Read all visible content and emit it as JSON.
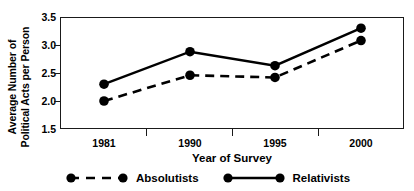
{
  "chart_data": {
    "type": "line",
    "title": "",
    "xlabel": "Year of Survey",
    "ylabel_line1": "Average Number of",
    "ylabel_line2": "Political Acts per Person",
    "categories": [
      "1981",
      "1990",
      "1995",
      "2000"
    ],
    "yticks": [
      "1.5",
      "2.0",
      "2.5",
      "3.0",
      "3.5"
    ],
    "ylim": [
      1.5,
      3.5
    ],
    "grid": false,
    "legend_position": "bottom",
    "series": [
      {
        "name": "Absolutists",
        "style": "dashed",
        "marker": "filled-circle",
        "color": "#000000",
        "values": [
          2.0,
          2.46,
          2.42,
          3.08
        ]
      },
      {
        "name": "Relativists",
        "style": "solid",
        "marker": "filled-circle",
        "color": "#000000",
        "values": [
          2.3,
          2.88,
          2.63,
          3.3
        ]
      }
    ]
  },
  "legend": {
    "items": [
      {
        "label": "Absolutists",
        "style": "dashed"
      },
      {
        "label": "Relativists",
        "style": "solid"
      }
    ]
  }
}
